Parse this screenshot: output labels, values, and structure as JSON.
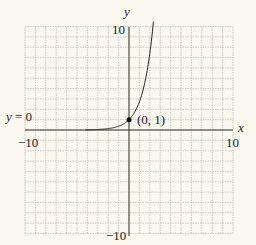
{
  "chart_data": {
    "type": "line",
    "title": "",
    "function": "y = e^x",
    "xlabel": "x",
    "ylabel": "y",
    "xlim": [
      -10,
      10
    ],
    "ylim": [
      -10,
      10
    ],
    "grid": true,
    "grid_step": 1,
    "tick_labels": {
      "x_min": "−10",
      "x_max": "10",
      "y_min": "−10",
      "y_max": "10"
    },
    "series": [
      {
        "name": "exponential curve",
        "x": [
          -10,
          -5,
          -4,
          -3,
          -2,
          -1,
          0,
          0.5,
          1,
          1.5,
          2,
          2.3
        ],
        "y": [
          5e-05,
          0.0067,
          0.018,
          0.05,
          0.14,
          0.37,
          1,
          1.65,
          2.72,
          4.48,
          7.39,
          9.97
        ]
      }
    ],
    "annotations": [
      {
        "text": "(0, 1)",
        "x": 0,
        "y": 1,
        "marker": "filled-dot"
      },
      {
        "text": "y = 0",
        "x": -10,
        "y": 0,
        "note": "horizontal asymptote label"
      }
    ]
  },
  "labels": {
    "y_axis": "y",
    "x_axis": "x",
    "y_max": "10",
    "y_min": "−10",
    "x_min": "−10",
    "x_max": "10",
    "point": "(0, 1)",
    "asymptote_y": "y",
    "asymptote_eq": " = 0"
  },
  "colors": {
    "background": "#fbf8ef",
    "grid": "#b9b6ae",
    "axis": "#333333",
    "curve": "#222222"
  }
}
